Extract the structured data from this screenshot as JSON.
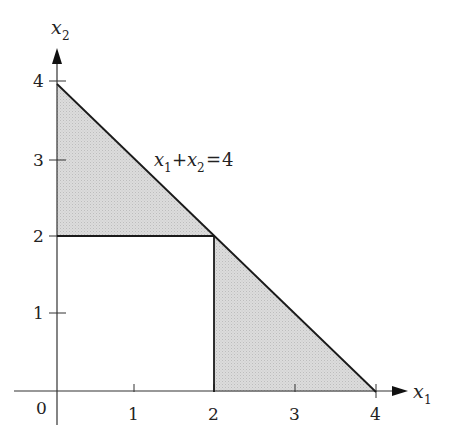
{
  "diagram": {
    "axes": {
      "x_label": "x",
      "x_label_sub": "1",
      "y_label": "x",
      "y_label_sub": "2",
      "origin_label": "0",
      "x_ticks": [
        "1",
        "2",
        "3",
        "4"
      ],
      "y_ticks": [
        "1",
        "2",
        "3",
        "4"
      ]
    },
    "constraint_line": {
      "equation": "x1 + x2 = 4",
      "var1": "x",
      "var1_sub": "1",
      "op_plus": "+",
      "var2": "x",
      "var2_sub": "2",
      "op_eq": "=",
      "rhs": "4"
    },
    "shaded_regions": [
      {
        "name": "upper-left-triangle",
        "vertices": [
          [
            0,
            2
          ],
          [
            0,
            4
          ],
          [
            2,
            2
          ]
        ]
      },
      {
        "name": "lower-right-triangle",
        "vertices": [
          [
            2,
            0
          ],
          [
            2,
            2
          ],
          [
            4,
            0
          ]
        ]
      }
    ],
    "boundary_segments": [
      {
        "from": [
          0,
          4
        ],
        "to": [
          4,
          0
        ]
      },
      {
        "from": [
          0,
          2
        ],
        "to": [
          2,
          2
        ]
      },
      {
        "from": [
          2,
          2
        ],
        "to": [
          2,
          0
        ]
      }
    ],
    "colors": {
      "shade": "#d6d6d6",
      "line": "#1a1a1a",
      "axis": "#333333"
    }
  }
}
